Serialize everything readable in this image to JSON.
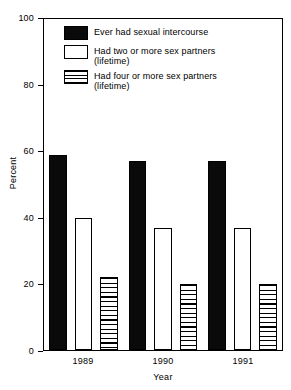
{
  "chart_data": {
    "type": "bar",
    "title": "",
    "subtitle": "",
    "xlabel": "Year",
    "ylabel": "Percent",
    "categories": [
      "1989",
      "1990",
      "1991"
    ],
    "series": [
      {
        "name": "Ever had sexual intercourse",
        "name_line2": "",
        "fill": "solid-black",
        "values": [
          59,
          57,
          57
        ]
      },
      {
        "name": "Had two or more sex partners",
        "name_line2": "(lifetime)",
        "fill": "open-white",
        "values": [
          40,
          37,
          37
        ]
      },
      {
        "name": "Had four or more sex partners",
        "name_line2": "(lifetime)",
        "fill": "horizontal-hatch",
        "values": [
          22,
          20,
          20
        ]
      }
    ],
    "ylim": [
      0,
      100
    ],
    "yticks": [
      "0",
      "20",
      "40",
      "60",
      "80",
      "100"
    ],
    "ytick_values": [
      0,
      20,
      40,
      60,
      80,
      100
    ],
    "grid": false,
    "legend_position": "inside-top-left",
    "frame": true,
    "colors": {
      "series1": "#0a0a0a",
      "series2": "#ffffff",
      "series3": "#ffffff",
      "axis": "#000000",
      "background": "#ffffff"
    }
  }
}
